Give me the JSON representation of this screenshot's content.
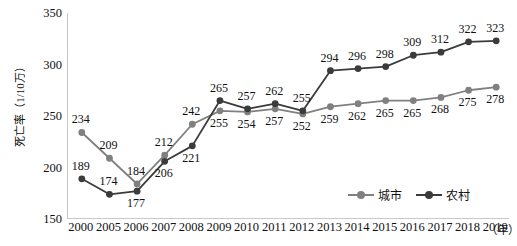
{
  "chart_data": {
    "type": "line",
    "title": "",
    "xlabel": "年",
    "ylabel": "死亡率（1/10万）",
    "ylim": [
      150,
      350
    ],
    "yticks": [
      150,
      200,
      250,
      300,
      350
    ],
    "grid": false,
    "legend_position": "bottom-right",
    "categories": [
      "2000",
      "2005",
      "2006",
      "2007",
      "2008",
      "2009",
      "2010",
      "2011",
      "2012",
      "2013",
      "2014",
      "2015",
      "2016",
      "2017",
      "2018",
      "2019"
    ],
    "series": [
      {
        "name": "城市",
        "color": "#808080",
        "values": [
          234,
          209,
          184,
          212,
          242,
          255,
          254,
          257,
          252,
          259,
          262,
          265,
          265,
          268,
          275,
          278
        ],
        "label_positions": [
          "above",
          "above",
          "above",
          "above",
          "above",
          "below",
          "below",
          "below",
          "below",
          "below",
          "below",
          "below",
          "below",
          "below",
          "below",
          "below"
        ]
      },
      {
        "name": "农村",
        "color": "#3b3b3b",
        "values": [
          189,
          174,
          177,
          206,
          221,
          265,
          257,
          262,
          255,
          294,
          296,
          298,
          309,
          312,
          322,
          323
        ],
        "label_positions": [
          "above",
          "above",
          "below",
          "below",
          "below",
          "above",
          "above",
          "above",
          "above",
          "above",
          "above",
          "above",
          "above",
          "above",
          "above",
          "above"
        ]
      }
    ]
  },
  "legend": {
    "items": [
      {
        "label": "城市",
        "color": "#808080"
      },
      {
        "label": "农村",
        "color": "#3b3b3b"
      }
    ]
  },
  "axis": {
    "y_unit_label": "死亡率（1/10万）",
    "x_unit_label": "（年）"
  }
}
